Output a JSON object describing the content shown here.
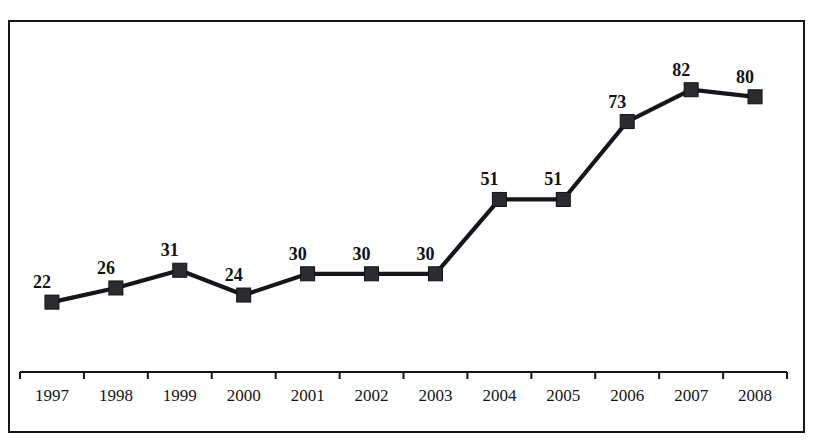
{
  "page": {
    "width": 814,
    "height": 445,
    "background": "#ffffff",
    "ink_color": "#16161a"
  },
  "title_strip": {
    "text": "",
    "note_visible": false
  },
  "chart_data": {
    "type": "line",
    "title": "",
    "subtitle": "",
    "xlabel": "",
    "ylabel": "",
    "categories": [
      "1997",
      "1998",
      "1999",
      "2000",
      "2001",
      "2002",
      "2003",
      "2004",
      "2005",
      "2006",
      "2007",
      "2008"
    ],
    "values": [
      22,
      26,
      31,
      24,
      30,
      30,
      30,
      51,
      51,
      73,
      82,
      80
    ],
    "data_labels": [
      "22",
      "26",
      "31",
      "24",
      "30",
      "30",
      "30",
      "51",
      "51",
      "73",
      "82",
      "80"
    ],
    "series": [
      {
        "name": "",
        "values": [
          22,
          26,
          31,
          24,
          30,
          30,
          30,
          51,
          51,
          73,
          82,
          80
        ],
        "line_color": "#16161a",
        "marker": "square",
        "marker_color": "#2b2b30"
      }
    ],
    "ylim": [
      0,
      93
    ],
    "xlim_categories": 12,
    "grid": false,
    "y_axis_visible": false,
    "x_axis_visible": true,
    "legend": false,
    "legend_position": "none",
    "show_data_labels": true,
    "axis_color": "#16161a",
    "geometry": {
      "axis_y_px": 350,
      "axis_x_start_px": 10,
      "axis_x_end_px": 777,
      "tick_count": 13,
      "tick_length_px": 7,
      "value_zero_y_px": 358,
      "px_per_unit": 3.54,
      "marker_size_px": 14
    }
  }
}
